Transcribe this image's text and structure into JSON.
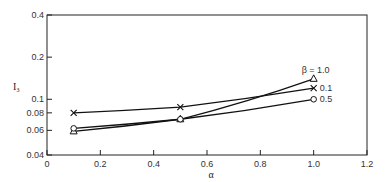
{
  "chart_data": {
    "type": "line",
    "title": "",
    "xlabel": "α",
    "ylabel": "I₃",
    "xlim": [
      0,
      1.2
    ],
    "ylim": [
      0.04,
      0.4
    ],
    "yscale": "log",
    "grid": false,
    "x_ticks": [
      "0",
      "0.2",
      "0.4",
      "0.6",
      "0.8",
      "1.0",
      "1.2"
    ],
    "y_ticks": [
      "0.04",
      "0.06",
      "0.08",
      "0.1",
      "0.2",
      "0.4"
    ],
    "x": [
      0.1,
      0.5,
      1.0
    ],
    "series": [
      {
        "name": "β = 1.0",
        "marker": "triangle",
        "values": [
          0.059,
          0.072,
          0.14
        ]
      },
      {
        "name": "0.1",
        "marker": "x",
        "values": [
          0.08,
          0.088,
          0.12
        ]
      },
      {
        "name": "0.5",
        "marker": "circle",
        "values": [
          0.062,
          0.072,
          0.1
        ]
      }
    ],
    "legend_position": "inline-right"
  }
}
